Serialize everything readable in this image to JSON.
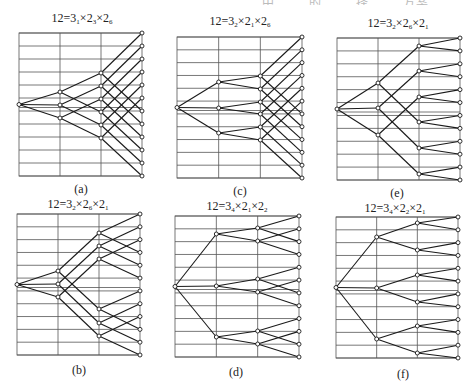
{
  "header_fragment": "…… 中 …… 的 …… 择 …… 方案",
  "grid_style": {
    "line_color": "#555555",
    "edge_color": "#1a1a1a",
    "node_fill": "#ffffff",
    "node_stroke": "#1a1a1a"
  },
  "panels": [
    {
      "id": "a",
      "caption": "(a)",
      "title": {
        "lead": "12=3",
        "s1": "1",
        "m1": "×2",
        "s2": "3",
        "m2": "×2",
        "s3": "6"
      },
      "title_pos": [
        82,
        19
      ],
      "caption_pos": [
        81,
        190
      ],
      "box": {
        "x": 19,
        "y": 33,
        "w": 123,
        "h": 143
      },
      "stage1": [
        59,
        72,
        85
      ],
      "stage2": [
        40,
        53,
        66,
        79,
        92,
        105
      ],
      "edges1": [
        [
          0,
          0
        ],
        [
          1,
          3
        ],
        [
          0,
          1
        ],
        [
          1,
          4
        ],
        [
          0,
          2
        ],
        [
          1,
          5
        ]
      ],
      "wiring": "a"
    },
    {
      "id": "c",
      "caption": "(c)",
      "title": {
        "lead": "12=3",
        "s1": "2",
        "m1": "×2",
        "s2": "1",
        "m2": "×2",
        "s3": "6"
      },
      "title_pos": [
        240,
        22
      ],
      "caption_pos": [
        240,
        192
      ],
      "box": {
        "x": 177,
        "y": 37,
        "w": 125,
        "h": 141
      },
      "stage1": [
        45,
        71,
        96
      ],
      "stage2": [
        39,
        52,
        65,
        77,
        90,
        103
      ],
      "wiring": "c"
    },
    {
      "id": "e",
      "caption": "(e)",
      "title": {
        "lead": "12=3",
        "s1": "2",
        "m1": "×2",
        "s2": "6",
        "m2": "×2",
        "s3": "1"
      },
      "title_pos": [
        398,
        24
      ],
      "caption_pos": [
        397,
        194
      ],
      "box": {
        "x": 337,
        "y": 38,
        "w": 123,
        "h": 142
      },
      "stage1": [
        45,
        70,
        97
      ],
      "stage2": [
        8,
        33,
        59,
        84,
        110,
        136
      ],
      "wiring": "e"
    },
    {
      "id": "b",
      "caption": "(b)",
      "title": {
        "lead": "12=3",
        "s1": "2",
        "m1": "×2",
        "s2": "6",
        "m2": "×2",
        "s3": "1"
      },
      "title_pos": [
        78,
        205
      ],
      "caption_pos": [
        79,
        371
      ],
      "box": {
        "x": 17,
        "y": 214,
        "w": 123,
        "h": 141
      },
      "stage1": [
        57,
        70,
        83
      ],
      "stage2": [
        19,
        32,
        45,
        95,
        109,
        122
      ],
      "wiring": "b"
    },
    {
      "id": "d",
      "caption": "(d)",
      "title": {
        "lead": "12=3",
        "s1": "4",
        "m1": "×2",
        "s2": "1",
        "m2": "×2",
        "s3": "2"
      },
      "title_pos": [
        237,
        207
      ],
      "caption_pos": [
        236,
        373
      ],
      "box": {
        "x": 175,
        "y": 216,
        "w": 124,
        "h": 141
      },
      "stage1": [
        18,
        70,
        121
      ],
      "stage2": [
        12,
        25,
        63,
        76,
        115,
        128
      ],
      "wiring": "d"
    },
    {
      "id": "f",
      "caption": "(f)",
      "title": {
        "lead": "12=3",
        "s1": "4",
        "m1": "×2",
        "s2": "2",
        "m2": "×2",
        "s3": "1"
      },
      "title_pos": [
        395,
        209
      ],
      "caption_pos": [
        403,
        375
      ],
      "box": {
        "x": 336,
        "y": 217,
        "w": 122,
        "h": 141
      },
      "stage1": [
        20,
        71,
        122
      ],
      "stage2": [
        6,
        33,
        58,
        85,
        109,
        136
      ],
      "wiring": "f"
    }
  ]
}
